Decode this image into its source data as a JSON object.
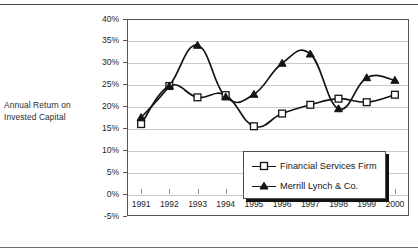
{
  "figure": {
    "axis_caption_line1": "Annual Return on",
    "axis_caption_line2": "Invested Capital"
  },
  "legend": {
    "position": "inside-bottom-center",
    "entries": [
      {
        "label": "Financial Services Firm",
        "marker": "open-square-marker"
      },
      {
        "label": "Merrill Lynch & Co.",
        "marker": "filled-triangle-marker"
      }
    ]
  },
  "chart_data": {
    "type": "line",
    "title": "",
    "xlabel": "",
    "ylabel": "Annual Return on Invested Capital",
    "categories": [
      "1991",
      "1992",
      "1993",
      "1994",
      "1995",
      "1996",
      "1997",
      "1998",
      "1999",
      "2000"
    ],
    "ylim": [
      -5,
      40
    ],
    "yticks": [
      -5,
      0,
      5,
      10,
      15,
      20,
      25,
      30,
      35,
      40
    ],
    "ytick_labels": [
      "-5%",
      "0%",
      "5%",
      "10%",
      "15%",
      "20%",
      "25%",
      "30%",
      "35%",
      "40%"
    ],
    "grid": true,
    "grid_axis": "y",
    "legend_position": "inside-bottom-center",
    "series": [
      {
        "name": "Financial Services Firm",
        "marker": "open-square-marker",
        "values": [
          16.0,
          24.7,
          22.1,
          22.6,
          15.5,
          18.4,
          20.4,
          21.8,
          21.0,
          22.7
        ]
      },
      {
        "name": "Merrill Lynch & Co.",
        "marker": "filled-triangle-marker",
        "values": [
          17.5,
          24.7,
          34.0,
          22.2,
          22.8,
          29.9,
          32.0,
          19.5,
          26.6,
          26.0
        ]
      }
    ]
  }
}
